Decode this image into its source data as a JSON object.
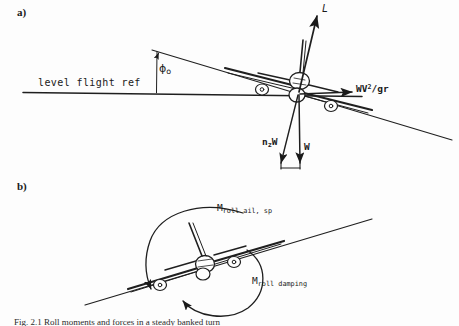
{
  "figure": {
    "caption": "Fig. 2.1   Roll moments and forces in a steady banked turn",
    "panels": [
      {
        "tag": "a)",
        "name": "forces-in-banked-turn"
      },
      {
        "tag": "b)",
        "name": "roll-moments"
      }
    ]
  },
  "panel_a": {
    "level_flight_ref": "level flight ref",
    "bank_angle": {
      "symbol": "ϕ",
      "subscript": "o"
    },
    "lift_vector": "L",
    "centrifugal_force": {
      "base": "WV",
      "exponent": "2",
      "denominator": "/gr"
    },
    "normal_load": {
      "base": "n",
      "subscript": "z",
      "suffix": "W"
    },
    "weight": "W"
  },
  "panel_b": {
    "applied_moment": {
      "symbol": "M",
      "subscript": "roll ail, sp"
    },
    "damping_moment": {
      "symbol": "M",
      "subscript": "roll damping"
    }
  },
  "colors": {
    "ink": "#1a1a1a",
    "paper": "#fdfdfd",
    "line": "#222222"
  }
}
